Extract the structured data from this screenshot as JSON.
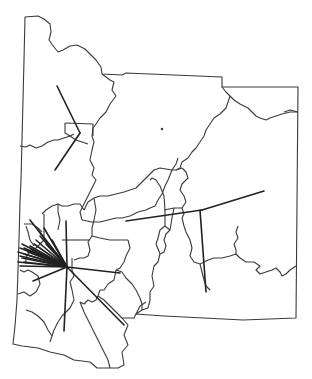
{
  "map": {
    "type": "outline-flow-map",
    "background": "#ffffff",
    "boundary_color": "#3a3a3a",
    "flow_color": "#222222",
    "outer_boundary": "M25,17 L38,16 L44,19 L50,24 L51,32 L49,40 L54,47 L58,52 L63,50 L70,46 L77,45 L85,49 L91,55 L96,60 L101,67 L102,74 L122,75 L126,73 L222,77 L222,87 L298,87 L296,318 L243,320 L164,316 L136,314 L134,318 L122,318 L128,325 L124,335 L128,345 L122,352 L124,365 L118,368 L97,368 L90,362 L74,360 L64,355 L50,352 L38,348 L22,346 L13,344 L15,326 L17,300 L19,240 L20,202 L21,180 L22,140 L24,60 Z",
    "inner_boundaries": [
      "M102,74 L110,80 L114,82 L112,90 L116,96 L110,104 L106,112 L100,118 L96,124 L93,128 L92,136 L94,142 L92,150 L90,160 L94,168 L92,175 L96,180 L92,188 L88,196 L84,204 L80,212 L82,220",
      "M65,123 L93,124 L93,136",
      "M65,123 L65,133 L70,136 L74,134",
      "M20,146 L26,147 L30,145 L36,148 L42,146 L48,142 L54,140 L58,140 L64,138 L70,136 L76,140 L82,142 L88,144",
      "M222,87 L226,92 L230,96 L234,100 L240,104 L248,108 L252,112 L256,116 L260,118 L266,120 L270,118 L276,116 L282,114 L290,112 L298,112",
      "M298,112 L290,110 L284,112",
      "M230,96 L226,108 L220,114 L214,118 L210,124 L206,130 L204,136 L200,142 L196,148 L192,152 L188,158 L182,162 L180,168 L176,170 L172,170",
      "M172,170 L176,164 L178,158",
      "M176,170 L182,168 L186,172 L188,178 L182,184 L180,190 L184,196 L186,202 L182,208 L184,214 L182,218",
      "M172,170 L160,168 L154,170 L148,176 L144,180 L140,184 L136,188 L130,190 L124,192 L116,194 L108,196 L100,196 L94,198 L88,202 L84,210",
      "M150,180 L152,178 L156,180 L160,186 L164,196 L165,210",
      "M164,210 L174,208 L182,208",
      "M174,208 L172,218 L170,230 L166,234 L164,240 L166,246 L164,252 L160,254 L158,262 L154,266 L152,276 L154,286 L150,292 L150,300 L148,308 L142,310 L136,314",
      "M165,210 L165,226 L160,230 L158,238 L156,244",
      "M165,226 L170,230",
      "M182,218 L184,226 L186,232 L190,240 L192,248 L190,256 L194,262 L200,264 L208,260 L214,258 L222,258 L230,256 L236,254 L240,258",
      "M200,264 L202,272 L204,280 L206,286 L210,290",
      "M156,244 L160,254",
      "M82,220 L92,222 L100,222 L108,220 L116,218 L122,218 L130,216 L138,212 L146,210 L150,208 L155,206 L158,200 L162,194 L165,186 L168,180 L172,170",
      "M240,258 L246,262 L254,262 L260,266 L256,270 L260,274 L266,272 L272,270 L276,268 L280,272 L282,276 L286,274 L290,270 L296,266",
      "M238,226 L236,232 L238,238 L234,244 L236,250 L236,254",
      "M94,198 L96,210 L94,220 L92,228 L92,236 L88,242 L90,250 L88,256 L84,258 L80,258 L74,260",
      "M42,214 L46,210 L52,206 L58,204 L62,206 L68,206 L74,204 L80,204 L84,210",
      "M44,214 L44,222 L44,234 L44,240 L40,244 L36,248 L30,250",
      "M30,250 L26,258 L26,264",
      "M58,204 L58,212 L60,220 L58,230",
      "M62,240 L70,240 L80,240 L90,240",
      "M72,258 L72,270 L74,276 L70,282 L72,290 L74,300 L70,308 L66,312",
      "M92,236 L100,238 L110,240 L120,240 L128,240",
      "M128,240 L130,248 L126,256 L124,262 L120,268 L116,270",
      "M116,270 L114,280 L108,284 L104,290 L100,290",
      "M100,290 L98,296 L96,300 L92,302 L88,300 L84,304 L80,302",
      "M80,302 L84,312 L88,320 L92,328 L96,336 L100,344 L104,352 L108,360 L110,368",
      "M98,296 L104,300 L110,306 L116,312 L122,318",
      "M116,270 L122,272 L126,278 L132,284 L136,290 L140,298 L142,304 L142,310",
      "M20,270 L24,272 L28,270 L32,272 L38,276 L40,284 L36,292 L30,296 L24,292 L18,294",
      "M26,310 L32,312 L38,316 L44,322 L48,330 L52,336 L50,342",
      "M66,312 L62,316 L58,322 L54,330 L52,336",
      "M26,226 L28,232 L30,240 L34,246",
      "M24,224 L32,224 L38,228 L42,232",
      "M136,314 L140,306 L146,302"
    ],
    "hub_point": [
      67,
      267
    ],
    "flow_lines": [
      [
        [
          57,
          86
        ],
        [
          80,
          133
        ]
      ],
      [
        [
          80,
          133
        ],
        [
          55,
          170
        ]
      ],
      [
        [
          126,
          221
        ],
        [
          202,
          210
        ]
      ],
      [
        [
          202,
          210
        ],
        [
          264,
          191
        ]
      ],
      [
        [
          200,
          210
        ],
        [
          206,
          292
        ]
      ],
      [
        [
          67,
          267
        ],
        [
          30,
          220
        ]
      ],
      [
        [
          67,
          267
        ],
        [
          66,
          221
        ]
      ],
      [
        [
          67,
          267
        ],
        [
          64,
          331
        ]
      ],
      [
        [
          67,
          267
        ],
        [
          120,
          273
        ]
      ],
      [
        [
          67,
          267
        ],
        [
          33,
          281
        ]
      ],
      [
        [
          67,
          267
        ],
        [
          124,
          325
        ]
      ],
      [
        [
          67,
          267
        ],
        [
          18,
          252
        ]
      ],
      [
        [
          67,
          267
        ],
        [
          20,
          248
        ]
      ],
      [
        [
          67,
          267
        ],
        [
          22,
          244
        ]
      ],
      [
        [
          67,
          267
        ],
        [
          24,
          248
        ]
      ],
      [
        [
          67,
          267
        ],
        [
          26,
          250
        ]
      ],
      [
        [
          67,
          267
        ],
        [
          28,
          252
        ]
      ],
      [
        [
          67,
          267
        ],
        [
          20,
          256
        ]
      ],
      [
        [
          67,
          267
        ],
        [
          22,
          258
        ]
      ],
      [
        [
          67,
          267
        ],
        [
          24,
          254
        ]
      ],
      [
        [
          67,
          267
        ],
        [
          30,
          246
        ]
      ],
      [
        [
          67,
          267
        ],
        [
          32,
          250
        ]
      ],
      [
        [
          67,
          267
        ],
        [
          34,
          244
        ]
      ],
      [
        [
          67,
          267
        ],
        [
          36,
          240
        ]
      ],
      [
        [
          67,
          267
        ],
        [
          40,
          236
        ]
      ],
      [
        [
          67,
          267
        ],
        [
          46,
          244
        ]
      ],
      [
        [
          67,
          267
        ],
        [
          38,
          230
        ]
      ],
      [
        [
          67,
          267
        ],
        [
          44,
          228
        ]
      ],
      [
        [
          67,
          267
        ],
        [
          52,
          240
        ]
      ],
      [
        [
          67,
          267
        ],
        [
          18,
          262
        ]
      ],
      [
        [
          67,
          267
        ],
        [
          20,
          266
        ]
      ],
      [
        [
          67,
          267
        ],
        [
          24,
          262
        ]
      ]
    ],
    "markers": [
      [
        162,
        129
      ]
    ]
  }
}
